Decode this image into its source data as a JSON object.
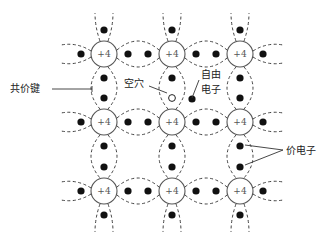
{
  "diagram": {
    "atom_charge_label": "+4",
    "atoms": [
      {
        "row": 0,
        "col": 0,
        "x": 104,
        "y": 54
      },
      {
        "row": 0,
        "col": 1,
        "x": 172,
        "y": 54
      },
      {
        "row": 0,
        "col": 2,
        "x": 240,
        "y": 54
      },
      {
        "row": 1,
        "col": 0,
        "x": 104,
        "y": 122
      },
      {
        "row": 1,
        "col": 1,
        "x": 172,
        "y": 122
      },
      {
        "row": 1,
        "col": 2,
        "x": 240,
        "y": 122
      },
      {
        "row": 2,
        "col": 0,
        "x": 104,
        "y": 191
      },
      {
        "row": 2,
        "col": 1,
        "x": 172,
        "y": 191
      },
      {
        "row": 2,
        "col": 2,
        "x": 240,
        "y": 191
      }
    ],
    "labels": {
      "covalent_bond": "共价键",
      "hole": "空穴",
      "free_electron_line1": "自由",
      "free_electron_line2": "电子",
      "valence_electron": "价电子"
    },
    "colors": {
      "electron": "#111111",
      "ring": "#555555",
      "dash": "#444444"
    }
  }
}
